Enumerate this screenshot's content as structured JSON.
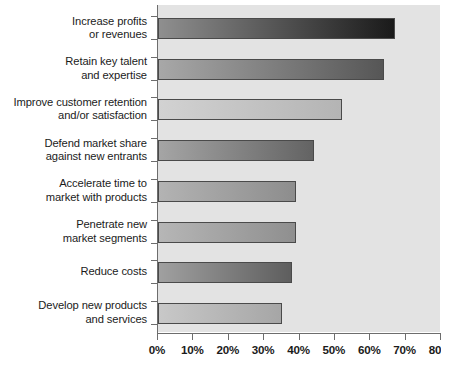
{
  "chart_data": {
    "type": "bar",
    "orientation": "horizontal",
    "title": "",
    "subtitle": "",
    "xlabel": "",
    "ylabel": "",
    "xlim": [
      0,
      80
    ],
    "grid": false,
    "legend": null,
    "categories": [
      "Increase profits or revenues",
      "Retain key talent and expertise",
      "Improve customer retention and/or satisfaction",
      "Defend market share against new entrants",
      "Accelerate time to market with products",
      "Penetrate new market segments",
      "Reduce costs",
      "Develop new products and services"
    ],
    "values": [
      67,
      64,
      52,
      44,
      39,
      39,
      38,
      35
    ],
    "value_unit": "%",
    "xticks": [
      0,
      10,
      20,
      30,
      40,
      50,
      60,
      70,
      80
    ],
    "xticklabels": [
      "0%",
      "10%",
      "20%",
      "30%",
      "40%",
      "50%",
      "60%",
      "70%",
      "80%"
    ]
  },
  "colors": {
    "plot_background": "#e3e3e3",
    "page_background": "#ffffff",
    "axis_line": "#6d6d6d",
    "bar_border": "#4a4a4a",
    "text": "#1b1b1b"
  },
  "rows": [
    {
      "label_lines": [
        "Increase profits",
        "or revenues"
      ],
      "value": 67,
      "value_label": "67%",
      "gradient_from": "#8f8f8f",
      "gradient_to": "#1a1a1a"
    },
    {
      "label_lines": [
        "Retain key talent",
        "and expertise"
      ],
      "value": 64,
      "value_label": "64%",
      "gradient_from": "#a8a8a8",
      "gradient_to": "#565656"
    },
    {
      "label_lines": [
        "Improve customer retention",
        "and/or satisfaction"
      ],
      "value": 52,
      "value_label": "52%",
      "gradient_from": "#d2d2d2",
      "gradient_to": "#b4b4b4"
    },
    {
      "label_lines": [
        "Defend market share",
        "against new entrants"
      ],
      "value": 44,
      "value_label": "44%",
      "gradient_from": "#a5a5a5",
      "gradient_to": "#636363"
    },
    {
      "label_lines": [
        "Accelerate time to",
        "market with products"
      ],
      "value": 39,
      "value_label": "39%",
      "gradient_from": "#b3b3b3",
      "gradient_to": "#8d8d8d"
    },
    {
      "label_lines": [
        "Penetrate new",
        "market segments"
      ],
      "value": 39,
      "value_label": "39%",
      "gradient_from": "#b6b6b6",
      "gradient_to": "#8f8f8f"
    },
    {
      "label_lines": [
        "Reduce costs"
      ],
      "value": 38,
      "value_label": "38%",
      "gradient_from": "#a0a0a0",
      "gradient_to": "#5e5e5e"
    },
    {
      "label_lines": [
        "Develop new products",
        "and services"
      ],
      "value": 35,
      "value_label": "35%",
      "gradient_from": "#c8c8c8",
      "gradient_to": "#a6a6a6"
    }
  ],
  "axis": {
    "ticks": [
      {
        "value": 0,
        "label": "0%"
      },
      {
        "value": 10,
        "label": "10%"
      },
      {
        "value": 20,
        "label": "20%"
      },
      {
        "value": 30,
        "label": "30%"
      },
      {
        "value": 40,
        "label": "40%"
      },
      {
        "value": 50,
        "label": "50%"
      },
      {
        "value": 60,
        "label": "60%"
      },
      {
        "value": 70,
        "label": "70%"
      },
      {
        "value": 80,
        "label": "80%"
      }
    ]
  }
}
